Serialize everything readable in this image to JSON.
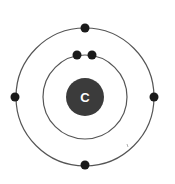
{
  "diagram": {
    "type": "bohr-model",
    "element_symbol": "C",
    "center": [
      85,
      97
    ],
    "nucleus": {
      "radius": 19,
      "color": "#3b3b3b",
      "label_color": "#ffffff"
    },
    "orbits": [
      {
        "name": "inner-shell",
        "radius": 42,
        "electrons": 2,
        "electron_positions": [
          [
            77,
            55
          ],
          [
            92,
            55
          ]
        ]
      },
      {
        "name": "outer-shell",
        "radius": 69,
        "electrons": 4,
        "electron_positions": [
          [
            85,
            28
          ],
          [
            15,
            97
          ],
          [
            154,
            97
          ],
          [
            85,
            165
          ]
        ]
      }
    ],
    "line_color": "#555555",
    "electron_color": "#1a1a1a",
    "electron_radius": 4.5
  }
}
